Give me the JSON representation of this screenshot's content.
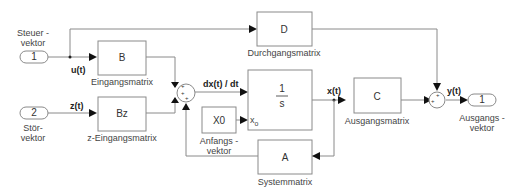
{
  "inports": [
    {
      "num": "1",
      "label1": "Steuer -",
      "label2": "vektor"
    },
    {
      "num": "2",
      "label1": "Stör-",
      "label2": "vektor"
    }
  ],
  "outport": {
    "num": "1",
    "label1": "Ausgangs -",
    "label2": "vektor"
  },
  "blocks": {
    "B": {
      "text": "B",
      "label": "Eingangsmatrix"
    },
    "Bz": {
      "text": "Bz",
      "label": "z-Eingangsmatrix"
    },
    "D": {
      "text": "D",
      "label": "Durchgangsmatrix"
    },
    "integrator": {
      "num": "1",
      "den": "s",
      "ic": "x",
      "ic_sub": "o"
    },
    "X0": {
      "text": "X0",
      "label1": "Anfangs -",
      "label2": "vektor"
    },
    "C": {
      "text": "C",
      "label": "Ausgangsmatrix"
    },
    "A": {
      "text": "A",
      "label": "Systemmatrix"
    }
  },
  "sums": {
    "sum1": {
      "signs": "+++"
    },
    "sum2": {
      "signs": "++"
    }
  },
  "signals": {
    "u": "u(t)",
    "z": "z(t)",
    "dx": "dx(t) / dt",
    "x": "x(t)",
    "y": "y(t)"
  }
}
